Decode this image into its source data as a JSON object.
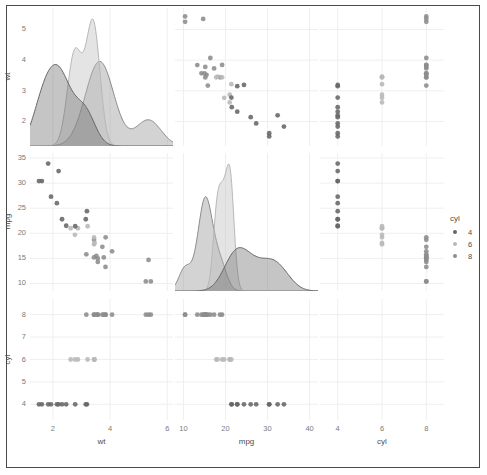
{
  "chart_data": {
    "type": "scatter",
    "title": "",
    "subtitle": "",
    "plot_kind": "pairs-matrix",
    "variables": [
      "wt",
      "mpg",
      "cyl"
    ],
    "color_by": "cyl",
    "grid": true,
    "legend": {
      "title": "cyl",
      "position": "right",
      "entries": [
        {
          "label": "4",
          "color": "#666666"
        },
        {
          "label": "6",
          "color": "#b8b8b8"
        },
        {
          "label": "8",
          "color": "#8c8c8c"
        }
      ]
    },
    "axes": {
      "wt": {
        "label": "wt",
        "ticks": [
          2,
          4,
          6
        ],
        "lim": [
          1.2,
          6.2
        ]
      },
      "mpg": {
        "label": "mpg",
        "ticks": [
          10,
          20,
          30,
          40
        ],
        "lim": [
          8,
          42
        ]
      },
      "cyl": {
        "label": "cyl",
        "ticks": [
          4,
          6,
          8
        ],
        "lim": [
          3.2,
          8.8
        ]
      }
    },
    "y_axes": {
      "wt": {
        "label": "wt",
        "ticks": [
          2,
          3,
          4,
          5
        ],
        "lim": [
          1.2,
          5.7
        ]
      },
      "mpg": {
        "label": "mpg",
        "ticks": [
          10,
          15,
          20,
          25,
          30,
          35
        ],
        "lim": [
          8.5,
          36
        ]
      },
      "cyl": {
        "label": "cyl",
        "ticks": [
          4,
          5,
          6,
          7,
          8
        ],
        "lim": [
          3.3,
          8.7
        ]
      }
    },
    "diagonal": {
      "type": "density",
      "panels": [
        "wt",
        "mpg",
        "cyl"
      ],
      "cyl_panel_empty": true,
      "groups": [
        {
          "cyl": "4",
          "color": "#666666"
        },
        {
          "cyl": "6",
          "color": "#b8b8b8"
        },
        {
          "cyl": "8",
          "color": "#8c8c8c"
        }
      ]
    },
    "points": [
      {
        "wt": 2.62,
        "mpg": 21.0,
        "cyl": 6
      },
      {
        "wt": 2.875,
        "mpg": 21.0,
        "cyl": 6
      },
      {
        "wt": 2.32,
        "mpg": 22.8,
        "cyl": 4
      },
      {
        "wt": 3.215,
        "mpg": 21.4,
        "cyl": 6
      },
      {
        "wt": 3.44,
        "mpg": 18.7,
        "cyl": 8
      },
      {
        "wt": 3.46,
        "mpg": 18.1,
        "cyl": 6
      },
      {
        "wt": 3.57,
        "mpg": 14.3,
        "cyl": 8
      },
      {
        "wt": 3.19,
        "mpg": 24.4,
        "cyl": 4
      },
      {
        "wt": 3.15,
        "mpg": 22.8,
        "cyl": 4
      },
      {
        "wt": 3.44,
        "mpg": 19.2,
        "cyl": 6
      },
      {
        "wt": 3.44,
        "mpg": 17.8,
        "cyl": 6
      },
      {
        "wt": 4.07,
        "mpg": 16.4,
        "cyl": 8
      },
      {
        "wt": 3.73,
        "mpg": 17.3,
        "cyl": 8
      },
      {
        "wt": 3.78,
        "mpg": 15.2,
        "cyl": 8
      },
      {
        "wt": 5.25,
        "mpg": 10.4,
        "cyl": 8
      },
      {
        "wt": 5.424,
        "mpg": 10.4,
        "cyl": 8
      },
      {
        "wt": 5.345,
        "mpg": 14.7,
        "cyl": 8
      },
      {
        "wt": 2.2,
        "mpg": 32.4,
        "cyl": 4
      },
      {
        "wt": 1.615,
        "mpg": 30.4,
        "cyl": 4
      },
      {
        "wt": 1.835,
        "mpg": 33.9,
        "cyl": 4
      },
      {
        "wt": 2.465,
        "mpg": 21.5,
        "cyl": 4
      },
      {
        "wt": 3.52,
        "mpg": 15.5,
        "cyl": 8
      },
      {
        "wt": 3.435,
        "mpg": 15.2,
        "cyl": 8
      },
      {
        "wt": 3.84,
        "mpg": 13.3,
        "cyl": 8
      },
      {
        "wt": 3.845,
        "mpg": 19.2,
        "cyl": 8
      },
      {
        "wt": 1.935,
        "mpg": 27.3,
        "cyl": 4
      },
      {
        "wt": 2.14,
        "mpg": 26.0,
        "cyl": 4
      },
      {
        "wt": 1.513,
        "mpg": 30.4,
        "cyl": 4
      },
      {
        "wt": 3.17,
        "mpg": 15.8,
        "cyl": 8
      },
      {
        "wt": 2.77,
        "mpg": 19.7,
        "cyl": 6
      },
      {
        "wt": 3.57,
        "mpg": 15.0,
        "cyl": 8
      },
      {
        "wt": 2.78,
        "mpg": 21.4,
        "cyl": 4
      }
    ]
  },
  "figure": {
    "matrix_rows": [
      {
        "row_var": "wt",
        "cells": [
          {
            "kind": "density",
            "x": "wt"
          },
          {
            "kind": "scatter",
            "x": "mpg",
            "y": "wt"
          },
          {
            "kind": "scatter",
            "x": "cyl",
            "y": "wt"
          }
        ]
      },
      {
        "row_var": "mpg",
        "cells": [
          {
            "kind": "scatter",
            "x": "wt",
            "y": "mpg"
          },
          {
            "kind": "density",
            "x": "mpg"
          },
          {
            "kind": "scatter",
            "x": "cyl",
            "y": "mpg"
          }
        ]
      },
      {
        "row_var": "cyl",
        "cells": [
          {
            "kind": "scatter",
            "x": "wt",
            "y": "cyl"
          },
          {
            "kind": "scatter",
            "x": "mpg",
            "y": "cyl"
          },
          {
            "kind": "empty",
            "x": "cyl"
          }
        ]
      }
    ],
    "x_axis_labels": [
      "wt",
      "mpg",
      "cyl"
    ],
    "y_axis_labels": [
      "wt",
      "mpg",
      "cyl"
    ],
    "x_ticks": {
      "wt": [
        "2",
        "4",
        "6"
      ],
      "mpg": [
        "10",
        "20",
        "30",
        "40"
      ],
      "cyl": [
        "4",
        "6",
        "8"
      ]
    },
    "y_ticks": {
      "wt": [
        "5",
        "4",
        "3",
        "2"
      ],
      "mpg": [
        "35",
        "30",
        "25",
        "20",
        "15",
        "10"
      ],
      "cyl": [
        "8",
        "7",
        "6",
        "5",
        "4"
      ]
    },
    "colors": {
      "background": "#ffffff",
      "frame": "#4a4a4a",
      "gridline": "#efefef",
      "tick_text": "#7a7a7a",
      "axis_label": "#4d4d4d",
      "cyl4": "#666666",
      "cyl6": "#b8b8b8",
      "cyl8": "#8c8c8c"
    }
  }
}
